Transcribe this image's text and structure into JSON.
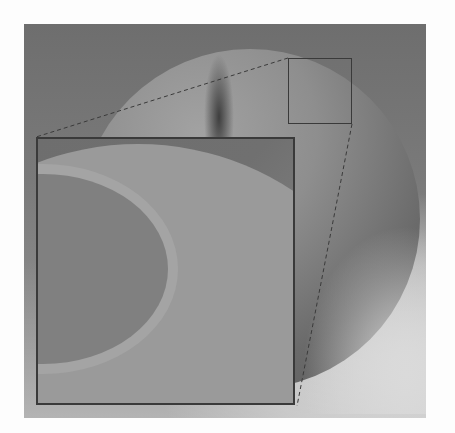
{
  "figure": {
    "type": "render-with-zoom-inset",
    "colors": {
      "background": "#fdfdfd",
      "frame_dark": "#6e6e6e",
      "sphere_light": "#a2a2a2",
      "box_outline": "#3a3a3a"
    },
    "zoom_source_box": {
      "x": 288,
      "y": 58,
      "w": 64,
      "h": 66
    },
    "inset_box": {
      "x": 36,
      "y": 137,
      "w": 259,
      "h": 268
    }
  }
}
